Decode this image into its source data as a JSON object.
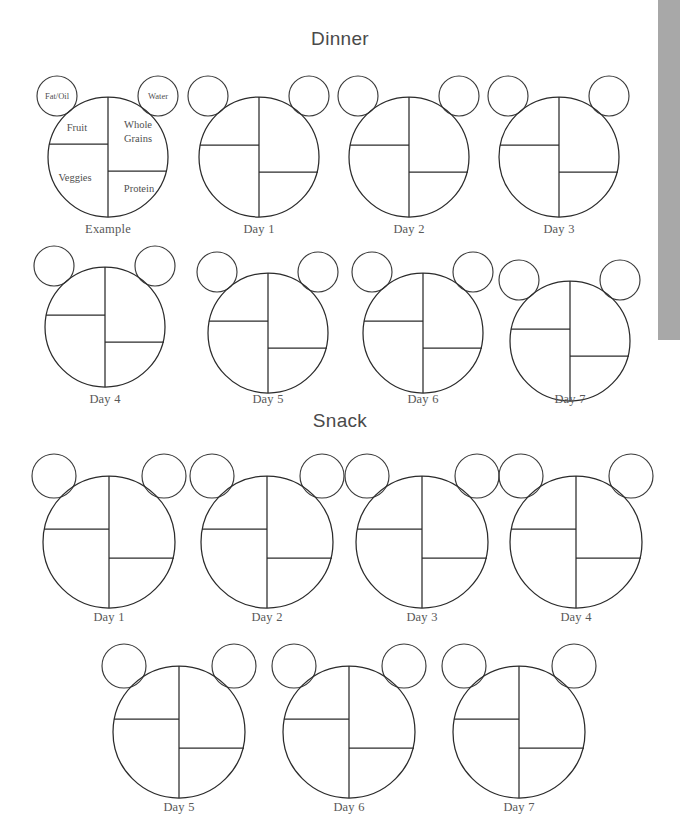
{
  "document": {
    "type": "meal-plate-worksheet",
    "background_color": "#ffffff",
    "ink_color": "#2b2b2b",
    "text_color": "#585858"
  },
  "sections": [
    {
      "id": "dinner",
      "title": "Dinner",
      "rows": [
        {
          "plates": [
            "Example",
            "Day 1",
            "Day 2",
            "Day 3"
          ]
        },
        {
          "plates": [
            "Day 4",
            "Day 5",
            "Day 6",
            "Day 7"
          ]
        }
      ]
    },
    {
      "id": "snack",
      "title": "Snack",
      "rows": [
        {
          "plates": [
            "Day 1",
            "Day 2",
            "Day 3",
            "Day 4"
          ]
        },
        {
          "plates": [
            "Day 5",
            "Day 6",
            "Day 7"
          ]
        }
      ]
    }
  ],
  "example_plate": {
    "caption": "Example",
    "quadrants": {
      "top_left": "Fruit",
      "top_right_line1": "Whole",
      "top_right_line2": "Grains",
      "bottom_left": "Veggies",
      "bottom_right": "Protein"
    },
    "bubbles": {
      "left": "Fat/Oil",
      "right": "Water"
    }
  },
  "labels": {
    "dinner_title": "Dinner",
    "snack_title": "Snack",
    "example": "Example",
    "day1": "Day 1",
    "day2": "Day 2",
    "day3": "Day 3",
    "day4": "Day 4",
    "day5": "Day 5",
    "day6": "Day 6",
    "day7": "Day 7",
    "fat_oil": "Fat/Oil",
    "water": "Water",
    "fruit": "Fruit",
    "whole": "Whole",
    "grains": "Grains",
    "veggies": "Veggies",
    "protein": "Protein"
  },
  "scrollbar": {
    "name": "vertical-scrollbar",
    "thumb_color": "#a8a8a8",
    "track_color": "#ffffff",
    "thumb_top": 0,
    "thumb_height": 340
  }
}
